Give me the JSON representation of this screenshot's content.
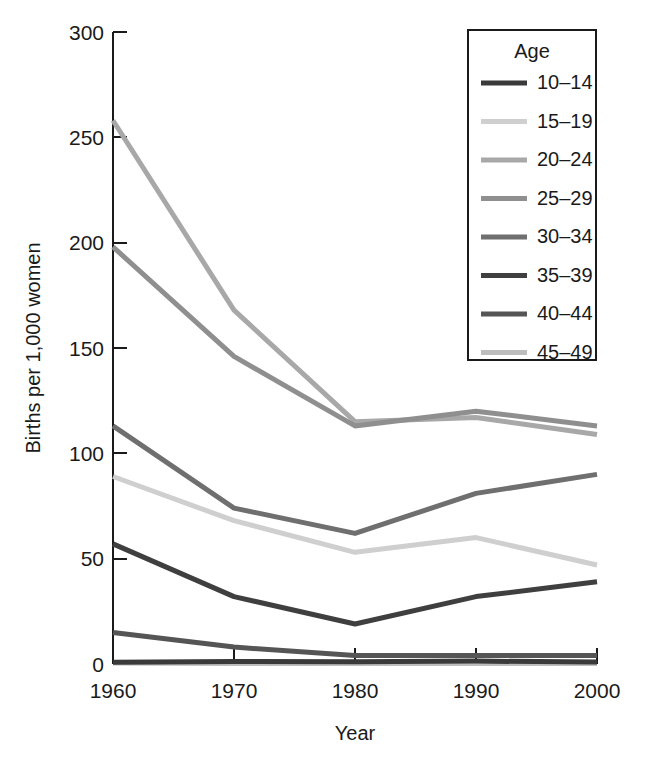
{
  "chart_data": {
    "type": "line",
    "title": "",
    "xlabel": "Year",
    "ylabel": "Births per 1,000 women",
    "x": [
      1960,
      1970,
      1980,
      1990,
      2000
    ],
    "xtick_labels": [
      "1960",
      "1970",
      "1980",
      "1990",
      "2000"
    ],
    "ytick_labels": [
      "0",
      "50",
      "100",
      "150",
      "200",
      "250",
      "300"
    ],
    "yticks": [
      0,
      50,
      100,
      150,
      200,
      250,
      300
    ],
    "xlim": [
      1960,
      2000
    ],
    "ylim": [
      0,
      300
    ],
    "grid": false,
    "legend_position": "top-right",
    "legend_title": "Age",
    "series": [
      {
        "name": "10–14",
        "color": "#3a3a3a",
        "values": [
          0.8,
          1.2,
          1.1,
          1.4,
          0.9
        ]
      },
      {
        "name": "15–19",
        "color": "#cfcfcf",
        "values": [
          89,
          68,
          53,
          60,
          47
        ]
      },
      {
        "name": "20–24",
        "color": "#a8a8a8",
        "values": [
          258,
          168,
          115,
          117,
          109
        ]
      },
      {
        "name": "25–29",
        "color": "#8f8f8f",
        "values": [
          198,
          146,
          113,
          120,
          113
        ]
      },
      {
        "name": "30–34",
        "color": "#6f6f6f",
        "values": [
          113,
          74,
          62,
          81,
          90
        ]
      },
      {
        "name": "35–39",
        "color": "#3f3f3f",
        "values": [
          57,
          32,
          19,
          32,
          39
        ]
      },
      {
        "name": "40–44",
        "color": "#555555",
        "values": [
          15,
          8,
          4,
          4,
          4
        ]
      },
      {
        "name": "45–49",
        "color": "#bdbdbd",
        "values": [
          0.5,
          0.3,
          0.2,
          0.2,
          0.2
        ]
      }
    ]
  },
  "axes": {
    "y_title": "Births per 1,000 women",
    "x_title": "Year"
  },
  "legend": {
    "title": "Age",
    "entries": [
      {
        "label": "10–14"
      },
      {
        "label": "15–19"
      },
      {
        "label": "20–24"
      },
      {
        "label": "25–29"
      },
      {
        "label": "30–34"
      },
      {
        "label": "35–39"
      },
      {
        "label": "40–44"
      },
      {
        "label": "45–49"
      }
    ]
  },
  "colors": {
    "background": "#ffffff",
    "foreground": "#1a1a1a",
    "axis": "#1a1a1a"
  }
}
